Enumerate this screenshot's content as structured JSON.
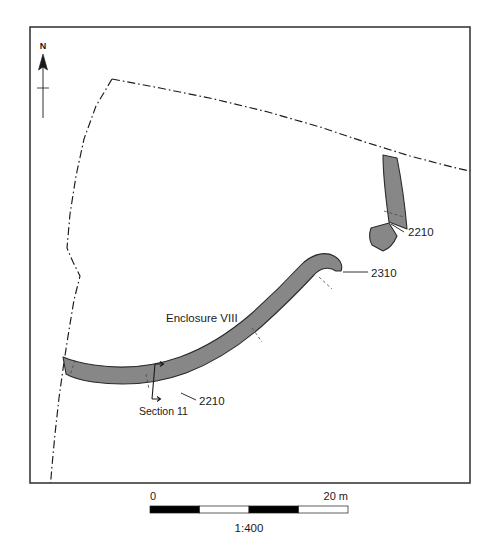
{
  "figure": {
    "type": "archaeological-site-plan",
    "feature_label": "Enclosure VIII",
    "frame": {
      "x": 30,
      "y": 27,
      "width": 440,
      "height": 456
    }
  },
  "north_arrow": {
    "letter": "N",
    "icon": "north-arrow-icon"
  },
  "annotations": {
    "enclosure_name": "Enclosure VIII",
    "context_upper": "2210",
    "context_middle": "2310",
    "context_lower": "2210",
    "section_label": "Section 11"
  },
  "scale_bar": {
    "start_label": "0",
    "end_label": "20 m",
    "ratio_label": "1:400",
    "segments": 4,
    "segment_fills": [
      "#000000",
      "#ffffff",
      "#000000",
      "#ffffff"
    ],
    "x_start": 150,
    "x_end": 348,
    "y": 506,
    "height": 7
  },
  "colors": {
    "ditch_fill": "#878787",
    "ditch_outline": "#2b2b2b",
    "frame_stroke": "#3a3a3a",
    "boundary_stroke": "#1a1a1a",
    "text": "#1a1a1a",
    "background": "#ffffff"
  },
  "features": [
    {
      "name": "ditch-segment-north",
      "context": "2210",
      "fill": "#878787"
    },
    {
      "name": "ditch-segment-north-terminal",
      "context": "2210",
      "fill": "#878787"
    },
    {
      "name": "ditch-segment-enclosure",
      "context": "2310",
      "fill": "#878787"
    }
  ],
  "boundary": {
    "name": "field-boundary",
    "style": "dash-dot"
  }
}
